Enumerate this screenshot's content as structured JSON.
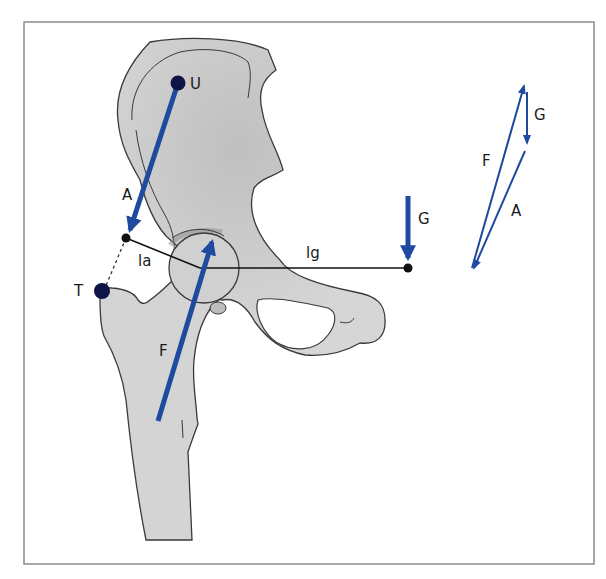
{
  "figure": {
    "colors": {
      "bone_fill": "#d4d4d4",
      "bone_dark": "#bdbdbd",
      "bone_outline": "#3a3a3a",
      "force_arrow": "#1f4aa0",
      "point": "#0d1547",
      "frame": "#8c8c8c"
    },
    "points": {
      "U": {
        "label": "U",
        "description": "Origin point on ilium"
      },
      "T": {
        "label": "T",
        "description": "Greater trochanter"
      }
    },
    "forces": {
      "A": {
        "label": "A",
        "description": "Abductor muscle force (U toward trochanter)"
      },
      "F": {
        "label": "F",
        "description": "Resultant joint force on femoral head"
      },
      "G": {
        "label": "G",
        "description": "Body weight"
      }
    },
    "lever_arms": {
      "la": {
        "label": "la",
        "description": "Lever arm of abductor force"
      },
      "lg": {
        "label": "lg",
        "description": "Lever arm of body weight"
      }
    },
    "vector_triangle": {
      "labels": {
        "F": "F",
        "G": "G",
        "A": "A"
      }
    }
  }
}
